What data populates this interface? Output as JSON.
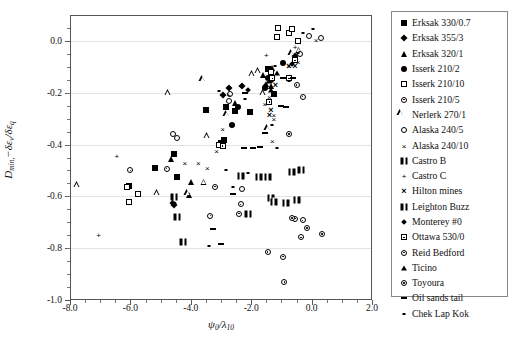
{
  "chart_data": {
    "type": "scatter",
    "title": "",
    "xlabel": "ψ₀/λ₁₀",
    "ylabel": "D_min, −δε_v/δε_q",
    "xlim": [
      -8.0,
      2.0
    ],
    "ylim": [
      -1.0,
      0.1
    ],
    "xticks": [
      "-8.0",
      "-6.0",
      "-4.0",
      "-2.0",
      "0.0",
      "2.0"
    ],
    "xtick_values": [
      -8.0,
      -6.0,
      -4.0,
      -2.0,
      0.0,
      2.0
    ],
    "yticks": [
      "0.0",
      "-0.2",
      "-0.4",
      "-0.6",
      "-0.8",
      "-1.0"
    ],
    "ytick_values": [
      0.0,
      -0.2,
      -0.4,
      -0.6,
      -0.8,
      -1.0
    ],
    "grid": true,
    "legend_position": "right-outside",
    "series": [
      {
        "name": "Erksak 330/0.7",
        "marker": "filled-square",
        "points": [
          [
            -3.5,
            -0.267
          ],
          [
            -2.85,
            -0.255
          ],
          [
            -2.55,
            -0.27
          ],
          [
            -2.05,
            -0.275
          ],
          [
            -4.55,
            -0.437
          ],
          [
            -2.9,
            -0.383
          ],
          [
            -5.2,
            -0.492
          ],
          [
            -3.0,
            -0.395
          ],
          [
            -6.05,
            -0.56
          ],
          [
            -4.45,
            -0.525
          ],
          [
            -1.25,
            -0.205
          ],
          [
            -1.45,
            -0.11
          ]
        ]
      },
      {
        "name": "Erksak 355/3",
        "marker": "diamond",
        "points": [
          [
            -2.75,
            -0.18
          ],
          [
            -2.3,
            -0.175
          ],
          [
            -2.95,
            -0.21
          ],
          [
            -4.6,
            -0.625
          ],
          [
            -1.35,
            -0.115
          ],
          [
            -0.55,
            -0.06
          ],
          [
            -4.55,
            -0.635
          ]
        ]
      },
      {
        "name": "Erksak 320/1",
        "marker": "filled-triangle",
        "points": [
          [
            -2.55,
            -0.24
          ],
          [
            -1.5,
            -0.165
          ],
          [
            -1.35,
            -0.175
          ],
          [
            -4.65,
            -0.455
          ],
          [
            -4.0,
            -0.545
          ],
          [
            -4.05,
            -0.595
          ],
          [
            -1.6,
            -0.13
          ],
          [
            -1.3,
            -0.105
          ]
        ]
      },
      {
        "name": "Isserk 210/2",
        "marker": "filled-circle",
        "points": [
          [
            -2.65,
            -0.325
          ],
          [
            -1.55,
            -0.18
          ],
          [
            -1.45,
            -0.145
          ],
          [
            -1.35,
            -0.15
          ],
          [
            -0.95,
            -0.085
          ],
          [
            -2.45,
            -0.255
          ]
        ]
      },
      {
        "name": "Isserk 210/10",
        "marker": "open-square",
        "points": [
          [
            -1.1,
            0.05
          ],
          [
            -1.15,
            0.015
          ],
          [
            -0.75,
            0.03
          ],
          [
            -0.65,
            0.045
          ],
          [
            -0.45,
            0.0
          ],
          [
            -6.1,
            -0.565
          ],
          [
            -5.75,
            -0.59
          ],
          [
            -6.05,
            -0.62
          ],
          [
            -3.05,
            -0.4
          ],
          [
            -1.35,
            -0.12
          ]
        ]
      },
      {
        "name": "Isserk 210/5",
        "marker": "circle-dot",
        "points": [
          [
            -6.0,
            -0.5
          ],
          [
            -4.8,
            -0.47
          ],
          [
            -2.35,
            -0.585
          ],
          [
            -3.35,
            -0.605
          ],
          [
            -3.2,
            -0.47
          ],
          [
            -0.5,
            -0.055
          ],
          [
            -0.75,
            -0.22
          ],
          [
            -2.4,
            -0.505
          ],
          [
            -0.3,
            -0.03
          ]
        ]
      },
      {
        "name": "Nerlerk 270/1",
        "marker": "open-triangle",
        "points": [
          [
            -7.65,
            -0.565
          ],
          [
            -4.65,
            -0.21
          ],
          [
            -3.5,
            -0.155
          ],
          [
            -3.35,
            -0.375
          ],
          [
            -2.7,
            -0.29
          ],
          [
            -1.85,
            -0.135
          ],
          [
            -1.65,
            -0.125
          ],
          [
            -1.5,
            -0.21
          ],
          [
            -1.35,
            -0.345
          ],
          [
            -3.45,
            -0.555
          ],
          [
            -5.0,
            -0.595
          ],
          [
            -4.0,
            -0.595
          ],
          [
            -0.3,
            -0.045
          ],
          [
            -0.55,
            -0.055
          ]
        ]
      },
      {
        "name": "Alaska 240/5",
        "marker": "open-circle",
        "points": [
          [
            -4.6,
            -0.36
          ],
          [
            -4.45,
            -0.375
          ],
          [
            -2.7,
            -0.205
          ],
          [
            -2.75,
            -0.23
          ],
          [
            -2.3,
            -0.57
          ],
          [
            -0.1,
            0.02
          ],
          [
            0.3,
            0.01
          ],
          [
            -0.4,
            -0.05
          ]
        ]
      },
      {
        "name": "Alaska 240/10",
        "marker": "x",
        "points": [
          [
            -2.95,
            -0.34
          ],
          [
            -3.15,
            -0.425
          ],
          [
            -1.4,
            -0.215
          ],
          [
            -1.25,
            -0.285
          ],
          [
            -1.25,
            -0.3
          ],
          [
            -1.3,
            -0.385
          ],
          [
            -4.2,
            -0.47
          ],
          [
            -3.75,
            -0.47
          ],
          [
            -1.55,
            -0.245
          ],
          [
            -0.75,
            -0.095
          ],
          [
            -0.45,
            -0.08
          ],
          [
            0.15,
            0.005
          ],
          [
            -3.45,
            -0.49
          ]
        ]
      },
      {
        "name": "Castro B",
        "marker": "square-x",
        "points": [
          [
            -4.45,
            -0.47
          ],
          [
            -4.25,
            -0.54
          ],
          [
            -2.35,
            -0.26
          ],
          [
            -1.75,
            -0.235
          ],
          [
            -4.55,
            -0.285
          ],
          [
            -1.45,
            -0.18
          ],
          [
            -0.65,
            -0.135
          ],
          [
            -0.35,
            -0.1
          ]
        ]
      },
      {
        "name": "Castro C",
        "marker": "plus",
        "points": [
          [
            -7.05,
            -0.75
          ],
          [
            -6.45,
            -0.445
          ],
          [
            -2.75,
            -0.21
          ],
          [
            -2.35,
            -0.175
          ],
          [
            -1.5,
            -0.055
          ],
          [
            -0.55,
            -0.025
          ]
        ]
      },
      {
        "name": "Hilton mines",
        "marker": "x-bold",
        "points": [
          [
            -1.35,
            -0.265
          ],
          [
            -1.4,
            -0.285
          ],
          [
            -1.2,
            -0.17
          ],
          [
            -0.75,
            -0.095
          ],
          [
            -0.55,
            -0.095
          ]
        ]
      },
      {
        "name": "Leighton Buzz",
        "marker": "square-x",
        "points": [
          [
            -2.1,
            -0.245
          ],
          [
            -1.35,
            -0.155
          ],
          [
            -1.25,
            -0.145
          ],
          [
            -0.85,
            -0.12
          ],
          [
            -0.5,
            -0.08
          ]
        ]
      },
      {
        "name": "Monterey #0",
        "marker": "diamond-small",
        "points": [
          [
            -4.55,
            -0.63
          ],
          [
            -2.1,
            -0.19
          ],
          [
            -1.55,
            -0.175
          ],
          [
            -0.65,
            -0.09
          ]
        ]
      },
      {
        "name": "Ottawa 530/0",
        "marker": "open-square-dot",
        "points": [
          [
            -2.95,
            -0.405
          ],
          [
            -1.4,
            -0.235
          ],
          [
            -1.3,
            -0.145
          ],
          [
            -0.55,
            -0.075
          ],
          [
            -0.75,
            -0.145
          ]
        ]
      },
      {
        "name": "Reid Bedford",
        "marker": "circle-dot",
        "points": [
          [
            -1.45,
            -0.255
          ],
          [
            -0.95,
            -0.25
          ],
          [
            -0.55,
            -0.08
          ],
          [
            -0.65,
            -0.055
          ],
          [
            -0.3,
            -0.04
          ]
        ]
      },
      {
        "name": "Ticino",
        "marker": "filled-triangle-small",
        "points": [
          [
            -1.55,
            -0.175
          ],
          [
            -1.35,
            -0.19
          ],
          [
            -1.4,
            -0.155
          ],
          [
            -1.15,
            -0.125
          ]
        ]
      },
      {
        "name": "Toyoura",
        "marker": "circle-dot-bold",
        "points": [
          [
            -0.9,
            -0.255
          ],
          [
            -0.35,
            -0.06
          ],
          [
            -0.15,
            0.0
          ],
          [
            0.35,
            0.0
          ]
        ]
      },
      {
        "name": "Oil sands tail",
        "marker": "dash",
        "points": [
          [
            -3.25,
            -0.725
          ],
          [
            -3.0,
            -0.785
          ],
          [
            -2.6,
            -0.59
          ],
          [
            -2.2,
            -0.2
          ],
          [
            -2.25,
            -0.415
          ],
          [
            -1.95,
            -0.415
          ],
          [
            -1.7,
            -0.41
          ],
          [
            -1.55,
            -0.355
          ],
          [
            -0.95,
            -0.145
          ],
          [
            -0.6,
            -0.145
          ],
          [
            -1.0,
            -0.25
          ],
          [
            -0.85,
            -0.255
          ]
        ]
      },
      {
        "name": "Chek Lap Kok",
        "marker": "small-dash",
        "points": [
          [
            -3.4,
            -0.79
          ],
          [
            -2.85,
            -0.5
          ],
          [
            -2.6,
            -0.565
          ],
          [
            -3.05,
            -0.195
          ],
          [
            -2.2,
            -0.225
          ],
          [
            -1.45,
            -0.105
          ],
          [
            -1.3,
            -0.325
          ],
          [
            -1.15,
            -0.415
          ],
          [
            -0.75,
            -0.155
          ],
          [
            -0.45,
            -0.045
          ],
          [
            -0.3,
            0.03
          ],
          [
            0.05,
            0.045
          ],
          [
            -2.1,
            -0.51
          ],
          [
            -1.2,
            -0.095
          ]
        ]
      }
    ]
  },
  "axes": {
    "x_label": "ψ",
    "x_label_sub": "0",
    "x_label_div": "/λ",
    "x_label_sub2": "10",
    "y_label_main": "D",
    "y_label_sub": "min,",
    "y_label_rest": "−δε",
    "y_label_sub2": "v",
    "y_label_rest2": "/δε",
    "y_label_sub3": "q"
  },
  "legend": {
    "items": [
      {
        "label": "Erksak 330/0.7",
        "marker": "filled-square"
      },
      {
        "label": "Erksak 355/3",
        "marker": "diamond"
      },
      {
        "label": "Erksak 320/1",
        "marker": "filled-triangle"
      },
      {
        "label": "Isserk 210/2",
        "marker": "filled-circle"
      },
      {
        "label": "Isserk 210/10",
        "marker": "open-square"
      },
      {
        "label": "Isserk 210/5",
        "marker": "circle-dot"
      },
      {
        "label": "Nerlerk 270/1",
        "marker": "open-triangle"
      },
      {
        "label": "Alaska 240/5",
        "marker": "open-circle"
      },
      {
        "label": "Alaska 240/10",
        "marker": "x"
      },
      {
        "label": "Castro B",
        "marker": "square-x"
      },
      {
        "label": "Castro C",
        "marker": "plus"
      },
      {
        "label": "Hilton mines",
        "marker": "x-bold"
      },
      {
        "label": "Leighton Buzz",
        "marker": "square-x"
      },
      {
        "label": "Monterey #0",
        "marker": "diamond-small"
      },
      {
        "label": "Ottawa 530/0",
        "marker": "open-square-dot"
      },
      {
        "label": "Reid Bedford",
        "marker": "circle-dot"
      },
      {
        "label": "Ticino",
        "marker": "filled-triangle-small"
      },
      {
        "label": "Toyoura",
        "marker": "circle-dot-bold"
      },
      {
        "label": "Oil sands tail",
        "marker": "dash"
      },
      {
        "label": "Chek Lap Kok",
        "marker": "small-dash"
      }
    ]
  },
  "colors": {
    "axis": "#555555",
    "grid": "#e2e2e2",
    "marker": "#000000",
    "background": "#ffffff"
  }
}
